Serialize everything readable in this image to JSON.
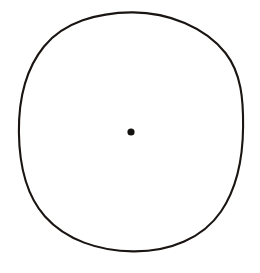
{
  "figure": {
    "name": "circle-with-center-point",
    "background_color": "#ffffff",
    "canvas": {
      "width": 260,
      "height": 273
    },
    "style": "hand-drawn ink line drawing",
    "caption": "",
    "elements": [
      {
        "id": "outer-circle",
        "kind": "ellipse",
        "label": "circle outline",
        "center_x": 131,
        "center_y": 131,
        "radius_x": 112,
        "radius_y": 119,
        "stroke_color": "#1a1512",
        "stroke_width": 2.1,
        "fill": "none"
      },
      {
        "id": "center-dot",
        "kind": "dot",
        "label": "centre point",
        "center_x": 131,
        "center_y": 132,
        "radius": 3.6,
        "fill_color": "#141210",
        "stroke_color": "none"
      }
    ],
    "colors": {
      "ink": "#1a1512",
      "dot": "#141210",
      "paper": "#ffffff"
    }
  }
}
